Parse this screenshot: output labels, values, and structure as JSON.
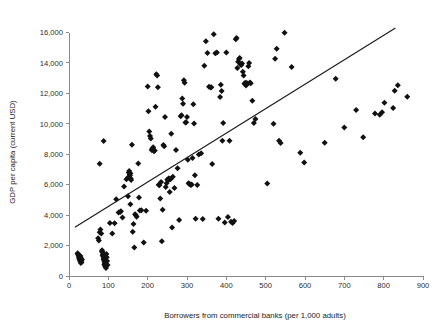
{
  "chart_data": {
    "type": "scatter",
    "title": "",
    "xlabel": "Borrowers from commercial banks (per 1,000 adults)",
    "ylabel": "GDP per capita (current USD)",
    "xlim": [
      0,
      900
    ],
    "ylim": [
      0,
      16000
    ],
    "grid": false,
    "legend": null,
    "xticks": [
      0,
      100,
      200,
      300,
      400,
      500,
      600,
      700,
      800,
      900
    ],
    "xtick_labels": [
      "0",
      "100",
      "200",
      "300",
      "400",
      "500",
      "600",
      "700",
      "800",
      "900"
    ],
    "yticks": [
      0,
      2000,
      4000,
      6000,
      8000,
      10000,
      12000,
      14000,
      16000
    ],
    "ytick_labels": [
      "0",
      "2,000",
      "4,000",
      "6,000",
      "8,000",
      "10,000",
      "12,000",
      "14,000",
      "16,000"
    ],
    "marker": "diamond",
    "marker_color": "#111111",
    "marker_size": 3.0,
    "trendline": {
      "type": "linear",
      "color": "#1a1a1a",
      "x_start": 15,
      "y_start": 3200,
      "x_end": 830,
      "y_end": 16300
    },
    "points": [
      [
        22,
        1500
      ],
      [
        24,
        1380
      ],
      [
        25,
        1250
      ],
      [
        26,
        1150
      ],
      [
        27,
        1060
      ],
      [
        28,
        980
      ],
      [
        29,
        1310
      ],
      [
        30,
        1180
      ],
      [
        31,
        1020
      ],
      [
        32,
        900
      ],
      [
        33,
        1080
      ],
      [
        23,
        1420
      ],
      [
        26,
        1330
      ],
      [
        30,
        860
      ],
      [
        28,
        1230
      ],
      [
        74,
        2480
      ],
      [
        76,
        2330
      ],
      [
        78,
        2880
      ],
      [
        80,
        3050
      ],
      [
        82,
        2790
      ],
      [
        84,
        1700
      ],
      [
        85,
        1560
      ],
      [
        86,
        1420
      ],
      [
        87,
        1300
      ],
      [
        88,
        1180
      ],
      [
        89,
        1060
      ],
      [
        90,
        940
      ],
      [
        91,
        820
      ],
      [
        92,
        700
      ],
      [
        93,
        600
      ],
      [
        94,
        520
      ],
      [
        84,
        1610
      ],
      [
        86,
        1340
      ],
      [
        88,
        1090
      ],
      [
        90,
        760
      ],
      [
        92,
        640
      ],
      [
        95,
        1450
      ],
      [
        96,
        1240
      ],
      [
        97,
        980
      ],
      [
        98,
        720
      ],
      [
        78,
        7380
      ],
      [
        88,
        8870
      ],
      [
        104,
        3480
      ],
      [
        110,
        2800
      ],
      [
        116,
        3460
      ],
      [
        120,
        5050
      ],
      [
        126,
        4180
      ],
      [
        130,
        4200
      ],
      [
        132,
        4250
      ],
      [
        136,
        3840
      ],
      [
        140,
        5880
      ],
      [
        146,
        6350
      ],
      [
        150,
        6480
      ],
      [
        152,
        6800
      ],
      [
        153,
        6900
      ],
      [
        154,
        6700
      ],
      [
        155,
        6600
      ],
      [
        156,
        6750
      ],
      [
        157,
        6400
      ],
      [
        158,
        6300
      ],
      [
        150,
        5240
      ],
      [
        156,
        4720
      ],
      [
        160,
        8620
      ],
      [
        162,
        2900
      ],
      [
        164,
        3420
      ],
      [
        166,
        1880
      ],
      [
        168,
        4060
      ],
      [
        170,
        4000
      ],
      [
        172,
        3900
      ],
      [
        176,
        7400
      ],
      [
        178,
        5160
      ],
      [
        180,
        4300
      ],
      [
        184,
        4320
      ],
      [
        190,
        2200
      ],
      [
        196,
        4280
      ],
      [
        200,
        12450
      ],
      [
        202,
        10830
      ],
      [
        204,
        9500
      ],
      [
        206,
        9200
      ],
      [
        208,
        9040
      ],
      [
        210,
        8280
      ],
      [
        212,
        8380
      ],
      [
        214,
        8460
      ],
      [
        216,
        8200
      ],
      [
        218,
        8240
      ],
      [
        220,
        11120
      ],
      [
        222,
        13250
      ],
      [
        224,
        13180
      ],
      [
        226,
        12400
      ],
      [
        228,
        6000
      ],
      [
        230,
        5960
      ],
      [
        232,
        5100
      ],
      [
        234,
        6180
      ],
      [
        236,
        2280
      ],
      [
        238,
        4350
      ],
      [
        240,
        8600
      ],
      [
        242,
        8520
      ],
      [
        244,
        10440
      ],
      [
        246,
        5850
      ],
      [
        248,
        6100
      ],
      [
        250,
        6340
      ],
      [
        252,
        6280
      ],
      [
        254,
        6420
      ],
      [
        256,
        5520
      ],
      [
        258,
        6360
      ],
      [
        260,
        9350
      ],
      [
        262,
        3180
      ],
      [
        264,
        6520
      ],
      [
        268,
        5780
      ],
      [
        272,
        8280
      ],
      [
        276,
        7080
      ],
      [
        280,
        3680
      ],
      [
        284,
        10500
      ],
      [
        286,
        10560
      ],
      [
        288,
        11660
      ],
      [
        290,
        11320
      ],
      [
        292,
        12860
      ],
      [
        294,
        12700
      ],
      [
        296,
        10080
      ],
      [
        298,
        10100
      ],
      [
        300,
        10440
      ],
      [
        302,
        7640
      ],
      [
        304,
        6100
      ],
      [
        306,
        6050
      ],
      [
        308,
        6020
      ],
      [
        310,
        5980
      ],
      [
        312,
        6020
      ],
      [
        314,
        7760
      ],
      [
        316,
        11280
      ],
      [
        318,
        10020
      ],
      [
        320,
        6620
      ],
      [
        322,
        3760
      ],
      [
        326,
        5980
      ],
      [
        330,
        7980
      ],
      [
        336,
        8060
      ],
      [
        340,
        3740
      ],
      [
        344,
        13820
      ],
      [
        348,
        15420
      ],
      [
        352,
        14660
      ],
      [
        356,
        12440
      ],
      [
        360,
        12380
      ],
      [
        362,
        12400
      ],
      [
        364,
        7360
      ],
      [
        368,
        15880
      ],
      [
        372,
        14640
      ],
      [
        376,
        14680
      ],
      [
        380,
        3760
      ],
      [
        384,
        11760
      ],
      [
        386,
        12560
      ],
      [
        388,
        12160
      ],
      [
        390,
        8880
      ],
      [
        392,
        10060
      ],
      [
        396,
        3520
      ],
      [
        400,
        14680
      ],
      [
        404,
        3880
      ],
      [
        408,
        8880
      ],
      [
        412,
        3560
      ],
      [
        416,
        3480
      ],
      [
        420,
        3620
      ],
      [
        424,
        15560
      ],
      [
        426,
        15640
      ],
      [
        428,
        13660
      ],
      [
        430,
        14080
      ],
      [
        432,
        14260
      ],
      [
        434,
        14320
      ],
      [
        436,
        13900
      ],
      [
        438,
        13860
      ],
      [
        440,
        13960
      ],
      [
        442,
        13420
      ],
      [
        444,
        13180
      ],
      [
        446,
        12640
      ],
      [
        448,
        12700
      ],
      [
        450,
        12520
      ],
      [
        452,
        12680
      ],
      [
        454,
        12640
      ],
      [
        456,
        13780
      ],
      [
        458,
        14000
      ],
      [
        460,
        12720
      ],
      [
        462,
        12660
      ],
      [
        466,
        11520
      ],
      [
        470,
        10060
      ],
      [
        474,
        10320
      ],
      [
        504,
        6080
      ],
      [
        520,
        10000
      ],
      [
        524,
        14280
      ],
      [
        528,
        14940
      ],
      [
        534,
        8880
      ],
      [
        538,
        8740
      ],
      [
        548,
        15980
      ],
      [
        566,
        13740
      ],
      [
        588,
        8100
      ],
      [
        598,
        7460
      ],
      [
        650,
        8760
      ],
      [
        678,
        12960
      ],
      [
        700,
        9760
      ],
      [
        730,
        10900
      ],
      [
        748,
        9120
      ],
      [
        778,
        10680
      ],
      [
        790,
        10600
      ],
      [
        796,
        10760
      ],
      [
        802,
        11380
      ],
      [
        824,
        11040
      ],
      [
        828,
        12180
      ],
      [
        836,
        12540
      ],
      [
        860,
        11780
      ]
    ]
  }
}
